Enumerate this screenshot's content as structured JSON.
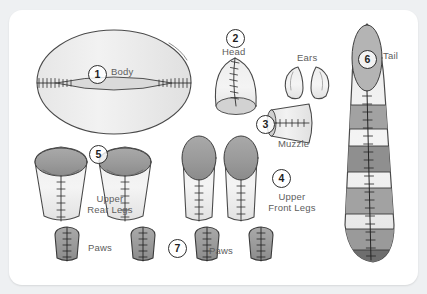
{
  "page": {
    "background_color": "#eef0f2",
    "card_color": "#ffffff"
  },
  "colors": {
    "outline": "#3a3a3a",
    "fill_light": "#f0f0f0",
    "fill_mid": "#d8d8d8",
    "fill_dark": "#9b9b9b",
    "fill_darker": "#8a8a8a",
    "label_text": "#5d5d5d",
    "number_text": "#1f1f1f"
  },
  "parts": [
    {
      "id": "body",
      "number": "1",
      "label": "Body",
      "label_lines": [
        "Body"
      ]
    },
    {
      "id": "head",
      "number": "2",
      "label": "Head",
      "label_lines": [
        "Head"
      ]
    },
    {
      "id": "muzzle",
      "number": "3",
      "label": "Muzzle",
      "label_lines": [
        "Muzzle"
      ]
    },
    {
      "id": "upper-front-legs",
      "number": "4",
      "label": "Upper Front Legs",
      "label_lines": [
        "Upper",
        "Front Legs"
      ]
    },
    {
      "id": "upper-rear-legs",
      "number": "5",
      "label": "Upper Rear Legs",
      "label_lines": [
        "Upper",
        "Rear Legs"
      ]
    },
    {
      "id": "tail",
      "number": "6",
      "label": "Tail",
      "label_lines": [
        "Tail"
      ]
    },
    {
      "id": "paws",
      "number": "7",
      "label": "Paws",
      "label_lines": [
        "Paws"
      ]
    },
    {
      "id": "ears",
      "number": "",
      "label": "Ears",
      "label_lines": [
        "Ears"
      ]
    }
  ],
  "labels": {
    "body": "Body",
    "head": "Head",
    "ears": "Ears",
    "muzzle": "Muzzle",
    "upper_front_legs_l1": "Upper",
    "upper_front_legs_l2": "Front Legs",
    "upper_rear_legs_l1": "Upper",
    "upper_rear_legs_l2": "Rear Legs",
    "tail": "Tail",
    "paws_left": "Paws",
    "paws_right": "Paws"
  },
  "numbers": {
    "body": "1",
    "head": "2",
    "muzzle": "3",
    "upper_front_legs": "4",
    "upper_rear_legs": "5",
    "tail": "6",
    "paws": "7"
  },
  "counts": {
    "ears": 2,
    "upper_rear_legs": 2,
    "upper_front_legs": 2,
    "paws": 4,
    "tail_stripes": 5
  }
}
